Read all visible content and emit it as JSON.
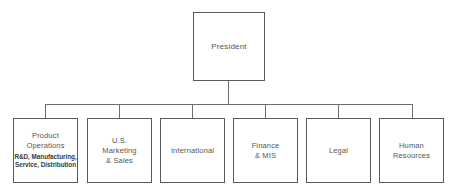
{
  "diagram": {
    "type": "organization-chart",
    "orientation": "top-down",
    "background_color": "#ffffff",
    "line_color": "#6e6e6e",
    "border_color": "#5a5a5a",
    "text_color": "#555555"
  },
  "root": {
    "label": "President"
  },
  "departments": [
    {
      "label": "Product\nOperations",
      "sublabel": "R&D, Manufacturing,\nService, Distribution"
    },
    {
      "label": "U.S.\nMarketing\n& Sales",
      "sublabel": ""
    },
    {
      "label": "International",
      "sublabel": ""
    },
    {
      "label": "Finance\n& MIS",
      "sublabel": ""
    },
    {
      "label": "Legal",
      "sublabel": ""
    },
    {
      "label": "Human\nResources",
      "sublabel": ""
    }
  ]
}
